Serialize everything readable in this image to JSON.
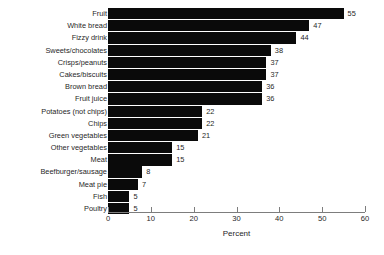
{
  "chart_data": {
    "type": "bar",
    "orientation": "horizontal",
    "title": "",
    "xlabel": "Percent",
    "ylabel": "",
    "xlim": [
      0,
      60
    ],
    "xticks": [
      0,
      10,
      20,
      30,
      40,
      50,
      60
    ],
    "grid": false,
    "legend": null,
    "bar_color": "#0a0a0a",
    "axis_color": "#7d7d7d",
    "background": "#ffffff",
    "value_labels_shown": true,
    "categories": [
      "Fruit",
      "White bread",
      "Fizzy drink",
      "Sweets/chocolates",
      "Crisps/peanuts",
      "Cakes/biscuits",
      "Brown bread",
      "Fruit juice",
      "Potatoes (not chips)",
      "Chips",
      "Green vegetables",
      "Other vegetables",
      "Meat",
      "Beefburger/sausage",
      "Meat pie",
      "Fish",
      "Poultry"
    ],
    "values": [
      55,
      47,
      44,
      38,
      37,
      37,
      36,
      36,
      22,
      22,
      21,
      15,
      15,
      8,
      7,
      5,
      5
    ],
    "value_label_texts": [
      "55",
      "47",
      "44",
      "38",
      "37",
      "37",
      "36",
      "36",
      "22",
      "22",
      "21",
      "15",
      "15",
      "8",
      "7",
      "5",
      "5"
    ]
  }
}
